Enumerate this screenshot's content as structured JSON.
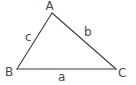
{
  "diagram": {
    "type": "triangle",
    "stroke_color": "#3a3a3a",
    "label_color": "#4a4a4a",
    "vertices": {
      "A": {
        "label": "A",
        "x": 52,
        "y": 13
      },
      "B": {
        "label": "B",
        "x": 17,
        "y": 69
      },
      "C": {
        "label": "C",
        "x": 116,
        "y": 69
      }
    },
    "sides": {
      "a": {
        "label": "a",
        "from": "B",
        "to": "C"
      },
      "b": {
        "label": "b",
        "from": "A",
        "to": "C"
      },
      "c": {
        "label": "c",
        "from": "A",
        "to": "B"
      }
    }
  }
}
